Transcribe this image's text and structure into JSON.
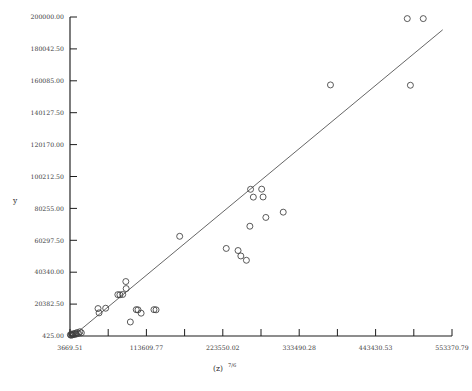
{
  "chart_data": {
    "type": "scatter",
    "title": "",
    "xlabel": "(z)^7/6",
    "xlabel_base": "(z)",
    "xlabel_exponent": "7/6",
    "ylabel": "y",
    "xlim": [
      3669.51,
      553370.79
    ],
    "ylim": [
      425.0,
      200000.0
    ],
    "grid": false,
    "legend": null,
    "x_tick_labels": [
      "3669.51",
      "113609.77",
      "223550.02",
      "333490.28",
      "443430.53",
      "553370.79"
    ],
    "x_tick_values": [
      3669.51,
      113609.77,
      223550.02,
      333490.28,
      443430.53,
      553370.79
    ],
    "x_minor_tick_count": 11,
    "y_tick_labels": [
      "425.00",
      "20382.50",
      "40340.00",
      "60297.50",
      "80255.00",
      "100212.50",
      "120170.00",
      "140127.50",
      "160085.00",
      "180042.50",
      "200000.00"
    ],
    "y_tick_values": [
      425.0,
      20382.5,
      40340.0,
      60297.5,
      80255.0,
      100212.5,
      120170.0,
      140127.5,
      160085.0,
      180042.5,
      200000.0
    ],
    "marker": "open-circle",
    "marker_size": 3.0,
    "point_color": "#3d3d3d",
    "line_color": "#4a4a4a",
    "axis_color": "#1d1d1d",
    "fit_line": {
      "x_start": 8000,
      "y_start": 425,
      "x_end": 540000,
      "y_end": 192000
    },
    "points": [
      {
        "x": 4200,
        "y": 1200
      },
      {
        "x": 5100,
        "y": 900
      },
      {
        "x": 6000,
        "y": 1500
      },
      {
        "x": 7000,
        "y": 1100
      },
      {
        "x": 8200,
        "y": 1800
      },
      {
        "x": 9500,
        "y": 1300
      },
      {
        "x": 11000,
        "y": 2100
      },
      {
        "x": 12500,
        "y": 1600
      },
      {
        "x": 14000,
        "y": 2600
      },
      {
        "x": 16000,
        "y": 2000
      },
      {
        "x": 18000,
        "y": 3100
      },
      {
        "x": 20000,
        "y": 2400
      },
      {
        "x": 44000,
        "y": 17600
      },
      {
        "x": 45500,
        "y": 14900
      },
      {
        "x": 55000,
        "y": 17800
      },
      {
        "x": 99000,
        "y": 16900
      },
      {
        "x": 101500,
        "y": 16800
      },
      {
        "x": 106000,
        "y": 14700
      },
      {
        "x": 72500,
        "y": 26300
      },
      {
        "x": 75500,
        "y": 26200
      },
      {
        "x": 79500,
        "y": 26400
      },
      {
        "x": 84500,
        "y": 30100
      },
      {
        "x": 84000,
        "y": 34500
      },
      {
        "x": 90500,
        "y": 9200
      },
      {
        "x": 124500,
        "y": 16900
      },
      {
        "x": 127500,
        "y": 16800
      },
      {
        "x": 161500,
        "y": 62800
      },
      {
        "x": 228500,
        "y": 55200
      },
      {
        "x": 245500,
        "y": 53900
      },
      {
        "x": 249500,
        "y": 50500
      },
      {
        "x": 257500,
        "y": 47800
      },
      {
        "x": 262500,
        "y": 69100
      },
      {
        "x": 263500,
        "y": 92200
      },
      {
        "x": 267500,
        "y": 87300
      },
      {
        "x": 279500,
        "y": 92300
      },
      {
        "x": 281500,
        "y": 87400
      },
      {
        "x": 285500,
        "y": 74600
      },
      {
        "x": 310500,
        "y": 77900
      },
      {
        "x": 378500,
        "y": 157500
      },
      {
        "x": 493500,
        "y": 157300
      },
      {
        "x": 489000,
        "y": 199000
      },
      {
        "x": 512000,
        "y": 199000
      }
    ]
  },
  "axis_geometry": {
    "plot_left": 70,
    "plot_right": 452,
    "plot_top": 17,
    "plot_bottom": 336
  }
}
